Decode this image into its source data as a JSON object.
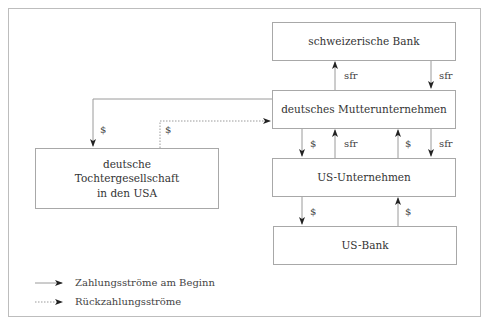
{
  "diagram": {
    "nodes": {
      "swiss_bank": "schweizerische Bank",
      "parent": "deutsches Mutterunternehmen",
      "subsidiary_line1": "deutsche",
      "subsidiary_line2": "Tochtergesellschaft",
      "subsidiary_line3": "in den USA",
      "us_company": "US-Unternehmen",
      "us_bank": "US-Bank"
    },
    "flows": [
      {
        "from": "parent",
        "to": "swiss_bank",
        "currency": "sfr",
        "type": "initial"
      },
      {
        "from": "swiss_bank",
        "to": "parent",
        "currency": "sfr",
        "type": "initial"
      },
      {
        "from": "parent",
        "to": "subsidiary",
        "currency": "$",
        "type": "initial"
      },
      {
        "from": "subsidiary",
        "to": "parent",
        "currency": "$",
        "type": "repayment"
      },
      {
        "from": "parent",
        "to": "us_company",
        "currency": "$",
        "type": "initial"
      },
      {
        "from": "us_company",
        "to": "parent",
        "currency": "sfr",
        "type": "initial"
      },
      {
        "from": "us_company",
        "to": "parent",
        "currency": "$",
        "type": "initial"
      },
      {
        "from": "parent",
        "to": "us_company",
        "currency": "sfr",
        "type": "initial"
      },
      {
        "from": "us_company",
        "to": "us_bank",
        "currency": "$",
        "type": "initial"
      },
      {
        "from": "us_bank",
        "to": "us_company",
        "currency": "$",
        "type": "initial"
      }
    ],
    "labels": {
      "sfr_up_top": "sfr",
      "sfr_down_top": "sfr",
      "usd_to_sub": "$",
      "usd_from_sub": "$",
      "usd_down_mid": "$",
      "sfr_up_mid": "sfr",
      "usd_up_mid": "$",
      "sfr_down_mid": "sfr",
      "usd_down_bottom": "$",
      "usd_up_bottom": "$"
    },
    "legend": {
      "solid": "Zahlungsströme am Beginn",
      "dotted": "Rückzahlungsströme"
    },
    "colors": {
      "line": "#9a9a9a",
      "arrowhead": "#222222",
      "border": "#a8a8a8"
    }
  }
}
